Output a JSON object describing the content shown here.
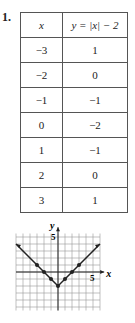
{
  "problem_number": "1.",
  "table": {
    "headers": [
      "x",
      "y = |x| − 2"
    ],
    "rows": [
      [
        "−3",
        "1"
      ],
      [
        "−2",
        "0"
      ],
      [
        "−1",
        "−1"
      ],
      [
        "0",
        "−2"
      ],
      [
        "1",
        "−1"
      ],
      [
        "2",
        "0"
      ],
      [
        "3",
        "1"
      ]
    ]
  },
  "chart_data": {
    "type": "line",
    "title": "",
    "xlabel": "x",
    "ylabel": "y",
    "xlim": [
      -6,
      6
    ],
    "ylim": [
      -5.5,
      5.5
    ],
    "tick_labels": {
      "x": "5",
      "y": "5"
    },
    "grid": true,
    "points": [
      [
        -3,
        1
      ],
      [
        -2,
        0
      ],
      [
        -1,
        -1
      ],
      [
        0,
        -2
      ],
      [
        1,
        -1
      ],
      [
        2,
        0
      ],
      [
        3,
        1
      ]
    ],
    "line_extends": [
      [
        -6,
        4
      ],
      [
        6,
        4
      ]
    ],
    "arrows_on_ends": true
  }
}
